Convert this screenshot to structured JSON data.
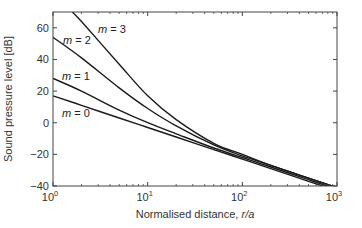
{
  "chart_data": {
    "type": "line",
    "title": "",
    "xlabel": "Normalised distance, r/a",
    "xlabel_parts": {
      "text": "Normalised distance, ",
      "italic": "r/a"
    },
    "ylabel": "Sound pressure level [dB]",
    "xscale": "log",
    "xlim": [
      1,
      1000
    ],
    "ylim": [
      -40,
      70
    ],
    "xticks": [
      1,
      10,
      100,
      1000
    ],
    "xtick_labels": [
      {
        "base": "10",
        "exp": "0"
      },
      {
        "base": "10",
        "exp": "1"
      },
      {
        "base": "10",
        "exp": "2"
      },
      {
        "base": "10",
        "exp": "3"
      }
    ],
    "yticks": [
      60,
      40,
      20,
      0,
      -20,
      -40
    ],
    "ytick_labels": [
      "60",
      "40",
      "20",
      "0",
      "−20",
      "−40"
    ],
    "grid": false,
    "legend": "inline labels",
    "series": [
      {
        "name": "m = 0",
        "label_m": "m",
        "label_val": " = 0",
        "x": [
          1,
          2,
          5,
          10,
          20,
          50,
          100,
          200,
          500,
          1000
        ],
        "y": [
          17,
          11,
          3,
          -3,
          -9,
          -17,
          -23,
          -29,
          -37,
          -43
        ]
      },
      {
        "name": "m = 1",
        "label_m": "m",
        "label_val": " = 1",
        "x": [
          1,
          2,
          5,
          10,
          20,
          50,
          100,
          200,
          500,
          1000
        ],
        "y": [
          28,
          20,
          8,
          0,
          -7,
          -16,
          -22,
          -28,
          -36,
          -42
        ]
      },
      {
        "name": "m = 2",
        "label_m": "m",
        "label_val": " = 2",
        "x": [
          1,
          2,
          5,
          10,
          20,
          50,
          100,
          200,
          500,
          1000
        ],
        "y": [
          54,
          41,
          22,
          9,
          -2,
          -14,
          -21,
          -27,
          -35,
          -41
        ]
      },
      {
        "name": "m = 3",
        "label_m": "m",
        "label_val": " = 3",
        "x": [
          1.6,
          2,
          5,
          10,
          20,
          50,
          100,
          200,
          500,
          1000
        ],
        "y": [
          70,
          64,
          37,
          17,
          2,
          -13,
          -20,
          -27,
          -35,
          -41
        ]
      }
    ]
  }
}
